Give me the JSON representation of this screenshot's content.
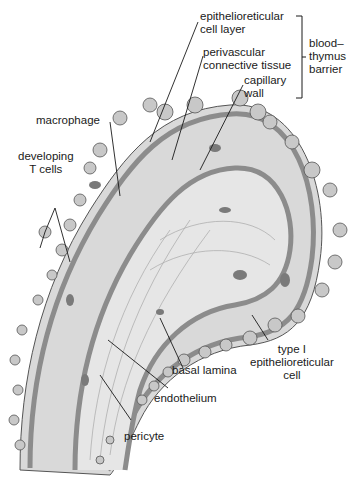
{
  "labels": {
    "epithelioreticular_cell_layer": [
      "epithelioreticular",
      "cell layer"
    ],
    "perivascular_connective_tissue": [
      "perivascular",
      "connective tissue"
    ],
    "capillary_wall": [
      "capillary",
      "wall"
    ],
    "blood_thymus_barrier": [
      "blood–",
      "thymus",
      "barrier"
    ],
    "macrophage": "macrophage",
    "developing_t_cells": [
      "developing",
      "T cells"
    ],
    "type_i_epithelioreticular_cell": [
      "type I",
      "epithelioreticular",
      "cell"
    ],
    "basal_lamina": "basal lamina",
    "endothelium": "endothelium",
    "pericyte": "pericyte"
  },
  "colors": {
    "tissue_fill": "#d9d9d9",
    "lumen_fill": "#e6e6e6",
    "wall_band": "#8c8c8c",
    "cell_fill": "#c8c8c8",
    "nucleus": "#7a7a7a",
    "line": "#1a1a1a"
  }
}
